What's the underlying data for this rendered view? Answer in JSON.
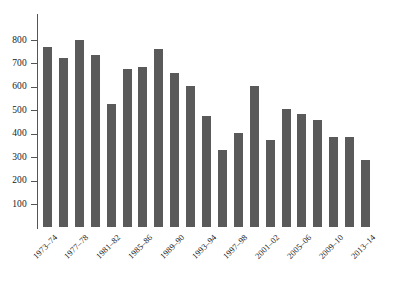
{
  "chart_data": {
    "type": "bar",
    "title": "",
    "subtitle": "",
    "xlabel": "",
    "ylabel": "",
    "ylim": [
      0,
      850
    ],
    "y_ticks": [
      100,
      200,
      300,
      400,
      500,
      600,
      700,
      800
    ],
    "grid": false,
    "legend": null,
    "bar_color": "#5a5a5a",
    "axis_color": "#555555",
    "n_bars": 22,
    "categories": [
      "1973-74",
      "1974-75",
      "1975-76",
      "1976-77",
      "1977-78",
      "1978-79",
      "1979-80",
      "1980-81",
      "1981-82",
      "1982-83",
      "1983-84",
      "1984-85",
      "1985-86",
      "1986-87",
      "1987-88",
      "1988-89",
      "1989-90",
      "1990-91",
      "1991-92",
      "1992-93",
      "1993-94",
      "1994-95"
    ],
    "values": [
      770,
      725,
      800,
      735,
      525,
      675,
      685,
      760,
      660,
      605,
      475,
      330,
      405,
      605,
      375,
      505,
      485,
      460,
      385,
      385,
      290,
      0
    ],
    "tick_labels": [
      "1973–74",
      "1977–78",
      "1981–82",
      "1985–86",
      "1989–90",
      "1993–94",
      "1997–98",
      "2001–02",
      "2005–06",
      "2009–10",
      "2013–14"
    ]
  }
}
